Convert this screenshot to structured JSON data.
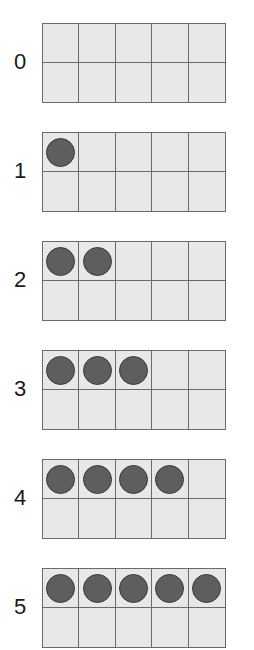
{
  "ten_frames": [
    {
      "label": "0",
      "count": 0
    },
    {
      "label": "1",
      "count": 1
    },
    {
      "label": "2",
      "count": 2
    },
    {
      "label": "3",
      "count": 3
    },
    {
      "label": "4",
      "count": 4
    },
    {
      "label": "5",
      "count": 5
    }
  ],
  "frame_columns": 5,
  "frame_rows": 2,
  "colors": {
    "cell_fill": "#e8e8e8",
    "grid_line": "#6b6b6b",
    "counter": "#5e5e5e"
  }
}
